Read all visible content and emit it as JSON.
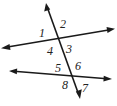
{
  "diagram": {
    "stroke_color": "#1a1a1a",
    "lines": [
      {
        "name": "transversal",
        "x1": 46,
        "y1": 4,
        "x2": 80,
        "y2": 98
      },
      {
        "name": "upper-line",
        "x1": 2,
        "y1": 48,
        "x2": 114,
        "y2": 29
      },
      {
        "name": "lower-line",
        "x1": 10,
        "y1": 71,
        "x2": 111,
        "y2": 79
      }
    ],
    "angles": [
      {
        "label": "1",
        "x": 39,
        "y": 37
      },
      {
        "label": "2",
        "x": 60,
        "y": 28
      },
      {
        "label": "3",
        "x": 66,
        "y": 53
      },
      {
        "label": "4",
        "x": 47,
        "y": 55
      },
      {
        "label": "5",
        "x": 55,
        "y": 72
      },
      {
        "label": "6",
        "x": 75,
        "y": 70
      },
      {
        "label": "7",
        "x": 82,
        "y": 92
      },
      {
        "label": "8",
        "x": 62,
        "y": 89
      }
    ]
  }
}
